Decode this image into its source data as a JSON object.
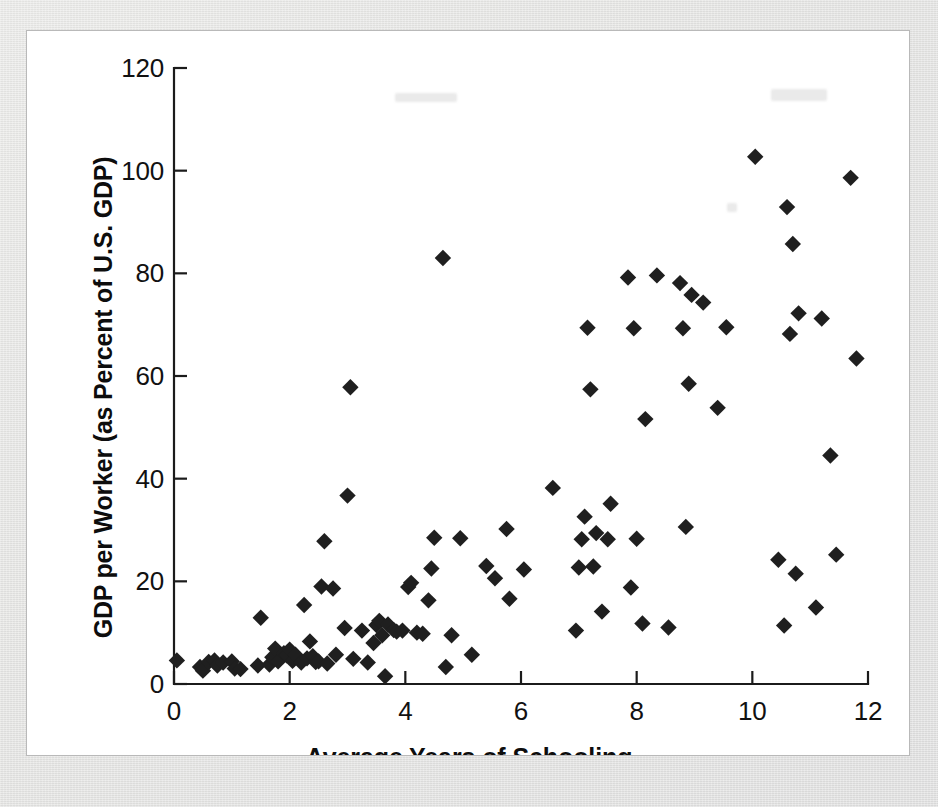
{
  "figure": {
    "background_color": "#ffffff",
    "mat_color": "#e5e5e3",
    "marker_color": "#1f1f1f",
    "axis_color": "#1b1b1b"
  },
  "chart_data": {
    "type": "scatter",
    "title": "",
    "subtitle": "",
    "xlabel": "Average Years of Schooling",
    "ylabel": "GDP per Worker (as Percent of U.S. GDP)",
    "xlim": [
      0,
      12
    ],
    "ylim": [
      0,
      120
    ],
    "xticks": [
      0,
      2,
      4,
      6,
      8,
      10,
      12
    ],
    "yticks": [
      0,
      20,
      40,
      60,
      80,
      100,
      120
    ],
    "xticklabels": [
      "0",
      "2",
      "4",
      "6",
      "8",
      "10",
      "12"
    ],
    "yticklabels": [
      "0",
      "20",
      "40",
      "60",
      "80",
      "100",
      "120"
    ],
    "grid": false,
    "legend": null,
    "legend_position": "none",
    "marker_shape": "diamond",
    "n_points": 116,
    "series": [
      {
        "name": "Countries",
        "points": [
          [
            0.05,
            4.6
          ],
          [
            0.45,
            3.3
          ],
          [
            0.5,
            2.6
          ],
          [
            0.6,
            4.3
          ],
          [
            0.7,
            4.6
          ],
          [
            0.75,
            3.6
          ],
          [
            0.85,
            4.2
          ],
          [
            1.0,
            4.4
          ],
          [
            1.05,
            3.0
          ],
          [
            1.15,
            2.9
          ],
          [
            1.45,
            3.6
          ],
          [
            1.5,
            12.9
          ],
          [
            1.65,
            3.8
          ],
          [
            1.7,
            5.2
          ],
          [
            1.75,
            6.9
          ],
          [
            1.8,
            4.4
          ],
          [
            1.9,
            6.0
          ],
          [
            1.95,
            5.6
          ],
          [
            2.0,
            6.7
          ],
          [
            2.05,
            4.5
          ],
          [
            2.1,
            5.7
          ],
          [
            2.2,
            4.2
          ],
          [
            2.25,
            15.4
          ],
          [
            2.3,
            5.0
          ],
          [
            2.35,
            8.3
          ],
          [
            2.4,
            5.4
          ],
          [
            2.45,
            4.3
          ],
          [
            2.5,
            4.4
          ],
          [
            2.55,
            19.0
          ],
          [
            2.6,
            27.8
          ],
          [
            2.65,
            4.0
          ],
          [
            2.75,
            18.6
          ],
          [
            2.8,
            5.7
          ],
          [
            2.95,
            10.9
          ],
          [
            3.0,
            36.7
          ],
          [
            3.05,
            57.8
          ],
          [
            3.1,
            4.9
          ],
          [
            3.25,
            10.4
          ],
          [
            3.35,
            4.2
          ],
          [
            3.45,
            8.0
          ],
          [
            3.5,
            11.5
          ],
          [
            3.55,
            12.3
          ],
          [
            3.6,
            9.5
          ],
          [
            3.65,
            1.5
          ],
          [
            3.7,
            11.6
          ],
          [
            3.8,
            10.5
          ],
          [
            3.85,
            10.2
          ],
          [
            3.95,
            10.4
          ],
          [
            4.05,
            18.9
          ],
          [
            4.1,
            19.7
          ],
          [
            4.2,
            10.0
          ],
          [
            4.3,
            9.8
          ],
          [
            4.4,
            16.3
          ],
          [
            4.45,
            22.5
          ],
          [
            4.5,
            28.5
          ],
          [
            4.65,
            83.0
          ],
          [
            4.7,
            3.3
          ],
          [
            4.8,
            9.5
          ],
          [
            4.95,
            28.4
          ],
          [
            5.15,
            5.7
          ],
          [
            5.4,
            23.0
          ],
          [
            5.55,
            20.6
          ],
          [
            5.75,
            30.2
          ],
          [
            5.8,
            16.6
          ],
          [
            6.05,
            22.3
          ],
          [
            6.55,
            38.2
          ],
          [
            6.95,
            10.4
          ],
          [
            7.0,
            22.7
          ],
          [
            7.05,
            28.2
          ],
          [
            7.1,
            32.6
          ],
          [
            7.15,
            69.4
          ],
          [
            7.2,
            57.4
          ],
          [
            7.25,
            22.9
          ],
          [
            7.3,
            29.4
          ],
          [
            7.4,
            14.1
          ],
          [
            7.5,
            28.2
          ],
          [
            7.55,
            35.1
          ],
          [
            7.85,
            79.2
          ],
          [
            7.9,
            18.8
          ],
          [
            7.95,
            69.3
          ],
          [
            8.0,
            28.3
          ],
          [
            8.1,
            11.8
          ],
          [
            8.15,
            51.6
          ],
          [
            8.35,
            79.6
          ],
          [
            8.55,
            11.0
          ],
          [
            8.75,
            78.1
          ],
          [
            8.8,
            69.3
          ],
          [
            8.85,
            30.6
          ],
          [
            8.9,
            58.5
          ],
          [
            8.95,
            75.8
          ],
          [
            9.15,
            74.3
          ],
          [
            9.4,
            53.8
          ],
          [
            9.55,
            69.5
          ],
          [
            10.05,
            102.7
          ],
          [
            10.45,
            24.2
          ],
          [
            10.55,
            11.4
          ],
          [
            10.6,
            92.9
          ],
          [
            10.65,
            68.2
          ],
          [
            10.7,
            85.7
          ],
          [
            10.75,
            21.5
          ],
          [
            10.8,
            72.2
          ],
          [
            11.1,
            14.9
          ],
          [
            11.2,
            71.2
          ],
          [
            11.35,
            44.5
          ],
          [
            11.45,
            25.2
          ],
          [
            11.7,
            98.6
          ],
          [
            11.8,
            63.4
          ]
        ]
      }
    ]
  },
  "axis_geometry": {
    "x_origin_px": 174,
    "y_origin_px": 684,
    "x_max_px": 868,
    "y_max_px": 68
  }
}
